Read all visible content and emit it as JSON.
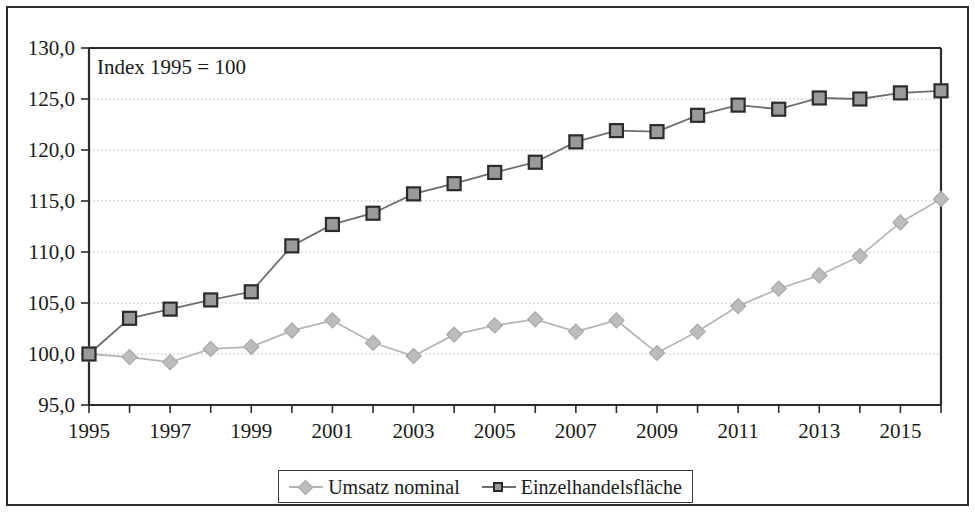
{
  "figure": {
    "annotation": "Index 1995 = 100"
  },
  "chart_data": {
    "type": "line",
    "title": "",
    "subtitle": "",
    "annotation": "Index 1995 = 100",
    "xlabel": "",
    "ylabel": "",
    "x": [
      1995,
      1996,
      1997,
      1998,
      1999,
      2000,
      2001,
      2002,
      2003,
      2004,
      2005,
      2006,
      2007,
      2008,
      2009,
      2010,
      2011,
      2012,
      2013,
      2014,
      2015,
      2016
    ],
    "categories": [
      "1995",
      "1996",
      "1997",
      "1998",
      "1999",
      "2000",
      "2001",
      "2002",
      "2003",
      "2004",
      "2005",
      "2006",
      "2007",
      "2008",
      "2009",
      "2010",
      "2011",
      "2012",
      "2013",
      "2014",
      "2015",
      "2016"
    ],
    "xtick_labels": [
      "1995",
      "1997",
      "1999",
      "2001",
      "2003",
      "2005",
      "2007",
      "2009",
      "2011",
      "2013",
      "2015"
    ],
    "xtick_values": [
      1995,
      1997,
      1999,
      2001,
      2003,
      2005,
      2007,
      2009,
      2011,
      2013,
      2015
    ],
    "ytick_labels": [
      "95,0",
      "100,0",
      "105,0",
      "110,0",
      "115,0",
      "120,0",
      "125,0",
      "130,0"
    ],
    "ytick_values": [
      95,
      100,
      105,
      110,
      115,
      120,
      125,
      130
    ],
    "xlim": [
      1995,
      2016
    ],
    "ylim": [
      95,
      130
    ],
    "grid": true,
    "legend_position": "bottom",
    "series": [
      {
        "name": "Umsatz nominal",
        "marker": "diamond",
        "color": "#bcbcbc",
        "line_color": "#b6b6b6",
        "values": [
          100.0,
          99.7,
          99.2,
          100.5,
          100.7,
          102.3,
          103.3,
          101.1,
          99.8,
          101.9,
          102.8,
          103.4,
          102.2,
          103.3,
          100.1,
          102.2,
          104.7,
          106.4,
          107.7,
          109.6,
          112.9,
          115.2
        ]
      },
      {
        "name": "Einzelhandelsfläche",
        "marker": "square",
        "color": "#9a9a9a",
        "line_color": "#6e6e6e",
        "values": [
          100.0,
          103.5,
          104.4,
          105.3,
          106.1,
          110.6,
          112.7,
          113.8,
          115.7,
          116.7,
          117.8,
          118.8,
          120.8,
          121.9,
          121.8,
          123.4,
          124.4,
          124.0,
          125.1,
          125.0,
          125.6,
          125.8
        ]
      }
    ]
  }
}
